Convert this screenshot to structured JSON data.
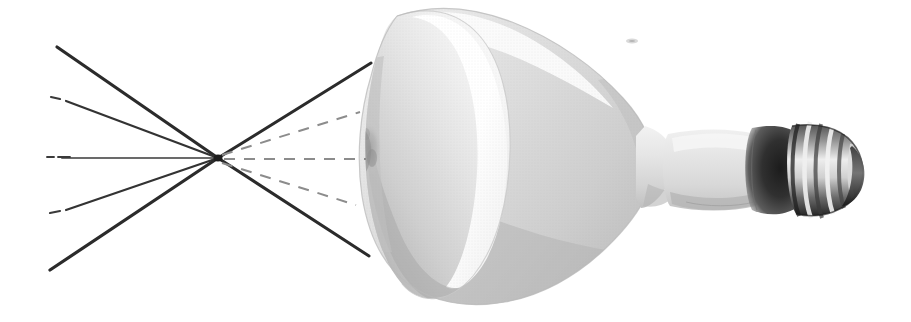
{
  "figure": {
    "title": "Reflector flood lamp with converging and diverging light ray diagram",
    "caption": "",
    "background_color": "#ffffff",
    "width": 911,
    "height": 322
  },
  "ray_diagram": {
    "focal_point": {
      "x": 218,
      "y": 158,
      "label": "focal-point"
    },
    "incoming_ray_color": "#2b2b2b",
    "outgoing_dashed_ray_color": "#8c8c8c",
    "rays": [
      {
        "id": "ray-upper-outer",
        "style": "solid",
        "color": "#2b2b2b",
        "width": 3.2,
        "from": {
          "x": 57,
          "y": 47
        },
        "to": {
          "x": 218,
          "y": 158
        }
      },
      {
        "id": "ray-upper-inner",
        "style": "solid",
        "color": "#333333",
        "width": 2.2,
        "from": {
          "x": 66,
          "y": 101
        },
        "to": {
          "x": 218,
          "y": 158
        }
      },
      {
        "id": "ray-axis-left",
        "style": "solid",
        "color": "#3a3a3a",
        "width": 1.7,
        "from": {
          "x": 62,
          "y": 158
        },
        "to": {
          "x": 218,
          "y": 158
        }
      },
      {
        "id": "ray-lower-inner",
        "style": "solid",
        "color": "#333333",
        "width": 2.2,
        "from": {
          "x": 66,
          "y": 210
        },
        "to": {
          "x": 218,
          "y": 158
        }
      },
      {
        "id": "ray-lower-outer",
        "style": "solid",
        "color": "#2b2b2b",
        "width": 3.2,
        "from": {
          "x": 50,
          "y": 270
        },
        "to": {
          "x": 218,
          "y": 158
        }
      },
      {
        "id": "ray-cross-upper-right",
        "style": "solid",
        "color": "#2b2b2b",
        "width": 3.0,
        "from": {
          "x": 218,
          "y": 158
        },
        "to": {
          "x": 371,
          "y": 63
        }
      },
      {
        "id": "ray-cross-lower-right",
        "style": "solid",
        "color": "#2b2b2b",
        "width": 3.0,
        "from": {
          "x": 218,
          "y": 158
        },
        "to": {
          "x": 369,
          "y": 256
        }
      },
      {
        "id": "ray-dashed-upper",
        "style": "dashed",
        "color": "#8c8c8c",
        "width": 2.0,
        "from": {
          "x": 222,
          "y": 155
        },
        "to": {
          "x": 360,
          "y": 112
        }
      },
      {
        "id": "ray-dashed-middle",
        "style": "dashed",
        "color": "#8c8c8c",
        "width": 2.0,
        "from": {
          "x": 224,
          "y": 159
        },
        "to": {
          "x": 366,
          "y": 159
        }
      },
      {
        "id": "ray-dashed-lower",
        "style": "dashed",
        "color": "#8c8c8c",
        "width": 2.0,
        "from": {
          "x": 222,
          "y": 163
        },
        "to": {
          "x": 356,
          "y": 205
        }
      }
    ],
    "leader_dashes": [
      {
        "id": "dash-upper-inner-start",
        "x1": 51,
        "y1": 97,
        "x2": 60,
        "y2": 99
      },
      {
        "id": "dash-axis-start-a",
        "x1": 47,
        "y1": 157,
        "x2": 54,
        "y2": 157
      },
      {
        "id": "dash-axis-start-b",
        "x1": 58,
        "y1": 157,
        "x2": 70,
        "y2": 157
      },
      {
        "id": "dash-lower-inner-start",
        "x1": 50,
        "y1": 213,
        "x2": 60,
        "y2": 211
      }
    ]
  },
  "lamp": {
    "name": "reflector-flood-lamp",
    "type": "BR / R incandescent reflector bulb",
    "base_type": "Edison screw (E26)",
    "colors": {
      "glass_light": "#f4f4f4",
      "glass_mid": "#dedede",
      "glass_shadow": "#c2c2c2",
      "glass_deep_shadow": "#a8a8a8",
      "face_highlight": "#ffffff",
      "neck": "#e3e3e3",
      "base_shoulder_dark": "#2f2f2f",
      "base_metal_dark": "#3d3d3d",
      "base_metal_light": "#e8e8e8",
      "outline": "#bdbdbd"
    },
    "parts": [
      {
        "id": "reflector-dome",
        "label": "reflector dome"
      },
      {
        "id": "concave-front-face",
        "label": "concave front face"
      },
      {
        "id": "face-rim-highlight",
        "label": "front face rim highlight"
      },
      {
        "id": "glass-smudge",
        "label": "glass surface blemish"
      },
      {
        "id": "neck",
        "label": "neck"
      },
      {
        "id": "base-shoulder",
        "label": "base shoulder"
      },
      {
        "id": "screw-threads",
        "label": "screw threads"
      },
      {
        "id": "base-tip",
        "label": "base contact tip"
      }
    ],
    "thread_count": 6,
    "speck": {
      "id": "dust-speck",
      "x": 632,
      "y": 41
    }
  }
}
